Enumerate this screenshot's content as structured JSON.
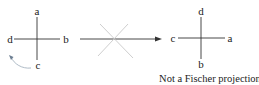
{
  "diagram": {
    "left_projection": {
      "top": "a",
      "left": "d",
      "right": "b",
      "bottom": "c"
    },
    "right_projection": {
      "top": "d",
      "left": "c",
      "right": "a",
      "bottom": "b"
    },
    "caption": "Not a Fischer projection",
    "colors": {
      "line": "#333333",
      "cross_out": "#c8c8c8",
      "rotation_arrow": "#9aa9b8"
    }
  }
}
